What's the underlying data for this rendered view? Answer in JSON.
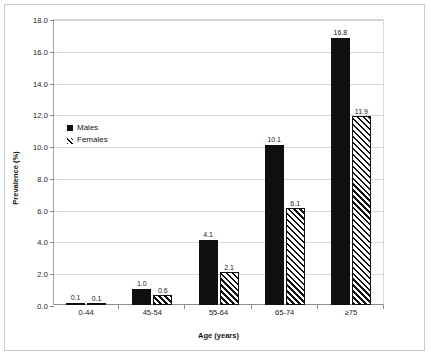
{
  "chart_data": {
    "type": "bar",
    "title": "",
    "subtitle": "",
    "xlabel": "Age (years)",
    "ylabel": "Prevalence (%)",
    "categories": [
      "0-44",
      "45-54",
      "55-64",
      "65-74",
      "≥75"
    ],
    "series": [
      {
        "name": "Males",
        "style": "solid-black",
        "color": "#101010",
        "values": [
          0.1,
          1.0,
          4.1,
          10.1,
          16.8
        ],
        "labels": [
          "0.1",
          "1.0",
          "4.1",
          "10.1",
          "16.8"
        ]
      },
      {
        "name": "Females",
        "style": "diagonal-hatch",
        "color": "#111111",
        "values": [
          0.1,
          0.6,
          2.1,
          6.1,
          11.9
        ],
        "labels": [
          "0.1",
          "0.6",
          "2.1",
          "6.1",
          "11.9"
        ]
      }
    ],
    "ylim": [
      0.0,
      18.0
    ],
    "ytick_step": 2.0,
    "yticks": [
      "0.0",
      "2.0",
      "4.0",
      "6.0",
      "8.0",
      "10.0",
      "12.0",
      "14.0",
      "16.0",
      "18.0"
    ],
    "grid": "horizontal",
    "data_labels": true,
    "legend": {
      "position": "inside-upper-left",
      "entries": [
        "Males",
        "Females"
      ]
    }
  },
  "axis": {
    "y_title": "Prevalence (%)",
    "x_title": "Age (years)"
  }
}
